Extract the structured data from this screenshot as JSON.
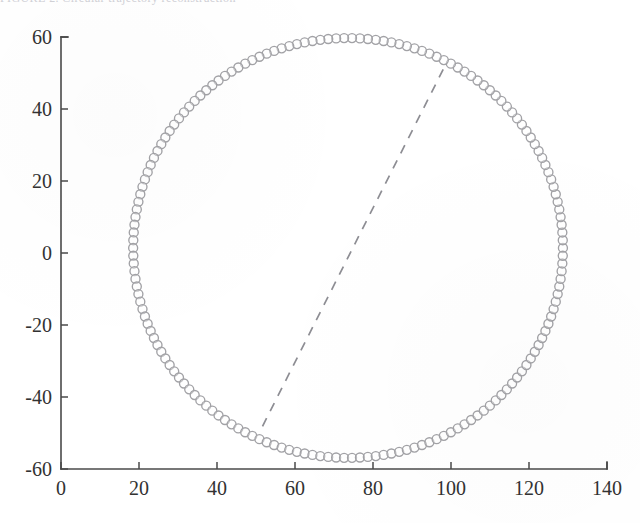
{
  "figure": {
    "clipped_caption_text": "FIGURE 2. Circular trajectory reconstruction",
    "background_color": "#ffffff",
    "marker_color": "#a2a2a6",
    "line_color": "#8d8d93",
    "axis_color": "#4a4a4a"
  },
  "chart_data": {
    "type": "scatter",
    "title": "",
    "xlabel": "",
    "ylabel": "",
    "xlim": [
      0,
      140
    ],
    "ylim": [
      -60,
      60
    ],
    "xticks": [
      0,
      20,
      40,
      60,
      80,
      100,
      120,
      140
    ],
    "yticks": [
      -60,
      -40,
      -20,
      0,
      20,
      40,
      60
    ],
    "xtick_labels": [
      "0",
      "20",
      "40",
      "60",
      "80",
      "100",
      "120",
      "140"
    ],
    "ytick_labels": [
      "-60",
      "-40",
      "-20",
      "0",
      "20",
      "40",
      "60"
    ],
    "grid": false,
    "legend": null,
    "series": [
      {
        "name": "circular-trajectory",
        "type": "scatter",
        "marker": "o",
        "marker_filled": false,
        "marker_size": 9,
        "n_points": 170,
        "shape": "circle",
        "center_x": 73.6,
        "center_y": 1.4,
        "radius_x": 55.1,
        "radius_y": 58.3
      },
      {
        "name": "chord-dashed",
        "type": "line",
        "linestyle": "--",
        "x": [
          98.0,
          51.5
        ],
        "y": [
          51.0,
          -48.5
        ]
      }
    ]
  }
}
